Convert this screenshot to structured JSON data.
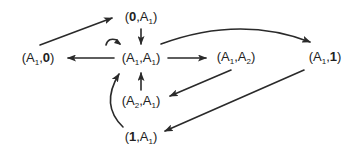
{
  "diagram": {
    "type": "directed-graph",
    "colors": {
      "edge": "#2a2a2a",
      "text": "#222222",
      "background": "#ffffff"
    },
    "nodes": [
      {
        "id": "n_0_A1",
        "label": "(0,A1)",
        "parts": {
          "open": "(",
          "first": "0",
          "first_bold": true,
          "first_sub": "",
          "sep": ",",
          "second": "A",
          "second_sub": "1",
          "close": ")"
        },
        "x": 141,
        "y": 17
      },
      {
        "id": "n_A1_0",
        "label": "(A1,0)",
        "parts": {
          "open": "(",
          "first": "A",
          "first_sub": "1",
          "sep": ",",
          "second": "0",
          "second_bold": true,
          "second_sub": "",
          "close": ")"
        },
        "x": 38,
        "y": 58
      },
      {
        "id": "n_A1_A1",
        "label": "(A1,A1)",
        "parts": {
          "open": "(",
          "first": "A",
          "first_sub": "1",
          "sep": ",",
          "second": "A",
          "second_sub": "1",
          "close": ")"
        },
        "x": 141,
        "y": 58
      },
      {
        "id": "n_A1_A2",
        "label": "(A1,A2)",
        "parts": {
          "open": "(",
          "first": "A",
          "first_sub": "1",
          "sep": ",",
          "second": "A",
          "second_sub": "2",
          "close": ")"
        },
        "x": 236,
        "y": 57
      },
      {
        "id": "n_A1_1",
        "label": "(A1,1)",
        "parts": {
          "open": "(",
          "first": "A",
          "first_sub": "1",
          "sep": ",",
          "second": "1",
          "second_bold": true,
          "second_sub": "",
          "close": ")"
        },
        "x": 325,
        "y": 57
      },
      {
        "id": "n_A2_A1",
        "label": "(A2,A1)",
        "parts": {
          "open": "(",
          "first": "A",
          "first_sub": "2",
          "sep": ",",
          "second": "A",
          "second_sub": "1",
          "close": ")"
        },
        "x": 141,
        "y": 101
      },
      {
        "id": "n_1_A1",
        "label": "(1,A1)",
        "parts": {
          "open": "(",
          "first": "1",
          "first_bold": true,
          "first_sub": "",
          "sep": ",",
          "second": "A",
          "second_sub": "1",
          "close": ")"
        },
        "x": 141,
        "y": 137
      }
    ],
    "edges": [
      {
        "from": "(A1,0)",
        "to": "(0,A1)",
        "shape": "straight"
      },
      {
        "from": "(0,A1)",
        "to": "(A1,A1)",
        "shape": "straight"
      },
      {
        "from": "(A1,A1)",
        "to": "(A1,0)",
        "shape": "straight"
      },
      {
        "from": "(A1,A1)",
        "to": "(A1,A2)",
        "shape": "straight"
      },
      {
        "from": "(A1,A1)",
        "to": "(A1,1)",
        "shape": "curved"
      },
      {
        "from": "(A1,A2)",
        "to": "(A2,A1)",
        "shape": "straight"
      },
      {
        "from": "(A2,A1)",
        "to": "(A1,A1)",
        "shape": "straight"
      },
      {
        "from": "(A1,1)",
        "to": "(1,A1)",
        "shape": "straight"
      },
      {
        "from": "(1,A1)",
        "to": "(A1,A1)",
        "shape": "curved"
      },
      {
        "from": "(A1,A1)",
        "to": "(A1,A1)",
        "shape": "self-loop"
      }
    ]
  }
}
